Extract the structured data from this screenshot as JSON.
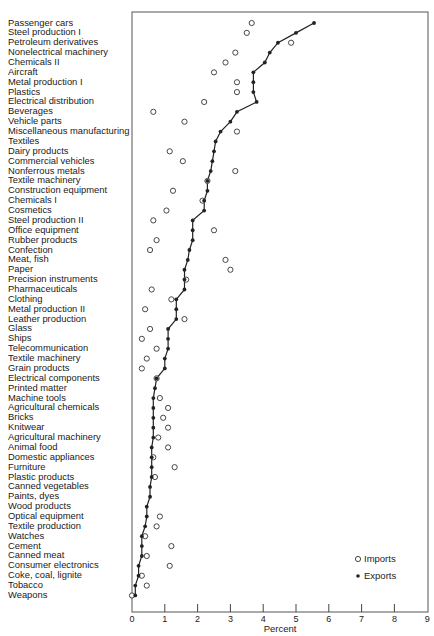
{
  "chart_data": {
    "type": "scatter",
    "title": "",
    "xlabel": "Percent",
    "ylabel": "",
    "xlim": [
      0,
      9
    ],
    "x_ticks": [
      "0",
      "1",
      "2",
      "3",
      "4",
      "5",
      "6",
      "7",
      "8",
      "9"
    ],
    "grid": false,
    "legend_position": "lower right",
    "legend": [
      "Imports",
      "Exports"
    ],
    "categories": [
      "Passenger cars",
      "Steel production I",
      "Petroleum derivatives",
      "Nonelectrical machinery",
      "Chemicals II",
      "Aircraft",
      "Metal production I",
      "Plastics",
      "Electrical distribution",
      "Beverages",
      "Vehicle parts",
      "Miscellaneous manufacturing",
      "Textiles",
      "Dairy products",
      "Commercial vehicles",
      "Nonferrous metals",
      "Textile machinery",
      "Construction equipment",
      "Chemicals I",
      "Cosmetics",
      "Steel production II",
      "Office equipment",
      "Rubber products",
      "Confection",
      "Meat, fish",
      "Paper",
      "Precision instruments",
      "Pharmaceuticals",
      "Clothing",
      "Metal production II",
      "Leather production",
      "Glass",
      "Ships",
      "Telecommunication",
      "Textile machinery",
      "Grain products",
      "Electrical components",
      "Printed matter",
      "Machine tools",
      "Agricultural chemicals",
      "Bricks",
      "Knitwear",
      "Agricultural machinery",
      "Animal food",
      "Domestic appliances",
      "Furniture",
      "Plastic products",
      "Canned vegetables",
      "Paints, dyes",
      "Wood products",
      "Optical equipment",
      "Textile production",
      "Watches",
      "Cement",
      "Canned meat",
      "Consumer electronics",
      "Coke, coal, lignite",
      "Tobacco",
      "Weapons"
    ],
    "series": [
      {
        "name": "Exports",
        "marker": "filled-dot-line",
        "values": [
          5.55,
          5.0,
          4.45,
          4.2,
          4.05,
          3.7,
          3.7,
          3.7,
          3.8,
          3.2,
          3.0,
          2.7,
          2.55,
          2.5,
          2.45,
          2.4,
          2.3,
          2.3,
          2.2,
          2.2,
          1.85,
          1.85,
          1.85,
          1.75,
          1.7,
          1.6,
          1.6,
          1.6,
          1.35,
          1.35,
          1.35,
          1.1,
          1.1,
          1.1,
          1.0,
          1.0,
          0.75,
          0.7,
          0.65,
          0.65,
          0.65,
          0.65,
          0.65,
          0.6,
          0.6,
          0.6,
          0.6,
          0.55,
          0.55,
          0.45,
          0.45,
          0.4,
          0.3,
          0.3,
          0.3,
          0.2,
          0.2,
          0.1,
          0.1
        ]
      },
      {
        "name": "Imports",
        "marker": "open-circle",
        "values": [
          3.65,
          3.5,
          4.85,
          3.15,
          2.85,
          2.5,
          3.2,
          3.2,
          2.2,
          0.65,
          1.6,
          3.2,
          null,
          1.15,
          1.55,
          3.15,
          2.3,
          1.25,
          2.15,
          1.05,
          0.65,
          2.5,
          0.75,
          0.55,
          2.85,
          3.0,
          1.65,
          0.6,
          1.2,
          0.4,
          1.6,
          0.55,
          0.3,
          0.75,
          0.45,
          0.3,
          0.75,
          null,
          0.85,
          1.1,
          0.95,
          1.1,
          0.8,
          1.1,
          0.65,
          1.3,
          0.7,
          null,
          null,
          null,
          0.85,
          0.75,
          0.4,
          1.2,
          0.45,
          1.15,
          0.3,
          0.45,
          0.0
        ]
      }
    ]
  },
  "axis": {
    "xlabel": "Percent",
    "ticks": [
      "0",
      "1",
      "2",
      "3",
      "4",
      "5",
      "6",
      "7",
      "8",
      "9"
    ]
  },
  "legend": {
    "imports_label": "Imports",
    "exports_label": "Exports"
  }
}
